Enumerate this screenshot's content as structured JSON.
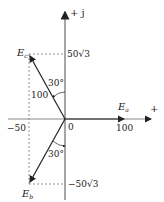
{
  "diagram": {
    "axes": {
      "imag_label": "+ j",
      "real_label": "+",
      "origin_label": "0"
    },
    "ticks": {
      "x_pos": "100",
      "x_neg": "−50",
      "y_pos": "50√3",
      "y_neg": "−50√3"
    },
    "phasors": {
      "a": {
        "label": "E",
        "sub": "a"
      },
      "b": {
        "label": "E",
        "sub": "b"
      },
      "c": {
        "label": "E",
        "sub": "c"
      }
    },
    "annotations": {
      "magnitude": "100",
      "angle_top": "30°",
      "angle_bottom": "30°"
    }
  }
}
